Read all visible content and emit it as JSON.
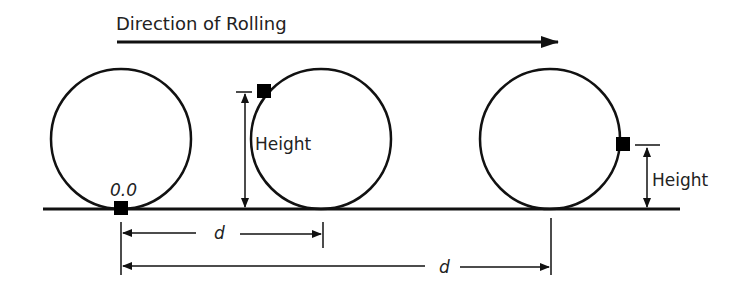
{
  "title": "Direction of Rolling",
  "labels": {
    "origin": "0.0",
    "height_1": "Height",
    "height_2": "Height",
    "distance_short": "d",
    "distance_long": "d"
  },
  "colors": {
    "stroke": "#111111",
    "marker": "#000000",
    "text": "#222222"
  },
  "elements": {
    "circles": [
      {
        "name": "wheel-start",
        "cx": 121,
        "cy": 139,
        "r": 70
      },
      {
        "name": "wheel-middle",
        "cx": 321,
        "cy": 139,
        "r": 70
      },
      {
        "name": "wheel-end",
        "cx": 550,
        "cy": 139,
        "r": 70
      }
    ],
    "markers": [
      {
        "name": "point-start",
        "x": 121,
        "y": 208
      },
      {
        "name": "point-middle",
        "x": 264,
        "y": 91
      },
      {
        "name": "point-end",
        "x": 623,
        "y": 144
      }
    ]
  }
}
